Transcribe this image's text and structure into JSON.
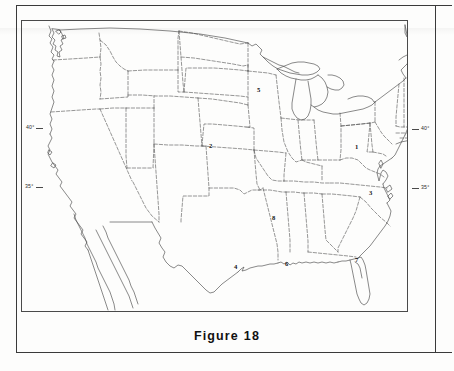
{
  "document": {
    "figure_caption_label": "Figure",
    "figure_caption_number": "18"
  },
  "map": {
    "title": "Blank outline map of the contiguous United States",
    "line_color": "#4a4a4a",
    "border_color": "#3a3a3a",
    "background_color": "#fdfdfc",
    "latitude_labels": [
      {
        "text": "40°",
        "side": "left",
        "x": 26,
        "y": 126
      },
      {
        "text": "35°",
        "side": "left",
        "x": 26,
        "y": 185
      },
      {
        "text": "40°",
        "side": "right",
        "x": 423,
        "y": 127
      },
      {
        "text": "35°",
        "side": "right",
        "x": 423,
        "y": 186
      }
    ],
    "markers": [
      {
        "label": "1",
        "x": 355,
        "y": 146,
        "region": "pennsylvania"
      },
      {
        "label": "2",
        "x": 209,
        "y": 146,
        "region": "nebraska"
      },
      {
        "label": "3",
        "x": 369,
        "y": 192,
        "region": "north-carolina"
      },
      {
        "label": "4",
        "x": 234,
        "y": 266,
        "region": "texas-gulf-coast"
      },
      {
        "label": "5",
        "x": 257,
        "y": 89,
        "region": "minnesota"
      },
      {
        "label": "6",
        "x": 285,
        "y": 263,
        "region": "louisiana"
      },
      {
        "label": "7",
        "x": 355,
        "y": 259,
        "region": "florida"
      },
      {
        "label": "8",
        "x": 272,
        "y": 217,
        "region": "arkansas"
      }
    ]
  }
}
